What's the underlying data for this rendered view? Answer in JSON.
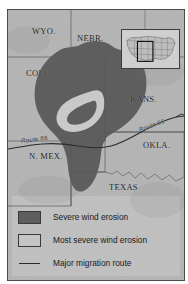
{
  "map": {
    "title": "Dust Bowl severe wind erosion map",
    "background_color": "#b9b9b9",
    "border_color": "#4b4b4b",
    "states": [
      {
        "id": "wyoming",
        "label": "WYO.",
        "x": 26,
        "y": 20
      },
      {
        "id": "nebraska",
        "label": "NEBR.",
        "x": 72,
        "y": 27
      },
      {
        "id": "colorado",
        "label": "COLO.",
        "x": 20,
        "y": 62
      },
      {
        "id": "kansas",
        "label": "KANS.",
        "x": 125,
        "y": 88
      },
      {
        "id": "oklahoma",
        "label": "OKLA.",
        "x": 138,
        "y": 134
      },
      {
        "id": "new-mexico",
        "label": "N. MEX.",
        "x": 23,
        "y": 145
      },
      {
        "id": "texas",
        "label": "TEXAS",
        "x": 104,
        "y": 176
      }
    ],
    "route_labels": [
      {
        "id": "route-66-west",
        "label": "Route 66",
        "x": 15,
        "y": 131,
        "rotation": -7
      },
      {
        "id": "route-66-east",
        "label": "Route 66",
        "x": 140,
        "y": 118,
        "rotation": -20
      }
    ]
  },
  "inset": {
    "name": "united-states-locator-inset",
    "highlight_region": "Southern Great Plains",
    "background_color": "#cacaca",
    "border_color": "#3d3d3d"
  },
  "legend": {
    "items": [
      {
        "id": "severe",
        "type": "swatch",
        "color": "#5e5e5e",
        "label": "Severe wind erosion"
      },
      {
        "id": "most-severe",
        "type": "swatch",
        "color": "#c5c5c5",
        "label": "Most severe wind erosion"
      },
      {
        "id": "migration",
        "type": "line",
        "color": "#2b2b2b",
        "label": "Major migration route"
      }
    ]
  },
  "colors": {
    "land": "#b9b9b9",
    "severe_erosion": "#5e5e5e",
    "most_severe_erosion": "#c5c5c5",
    "state_border": "#6f6f6f",
    "migration_route": "#2b2b2b",
    "frame": "#4b4b4b",
    "page": "#ffffff"
  }
}
